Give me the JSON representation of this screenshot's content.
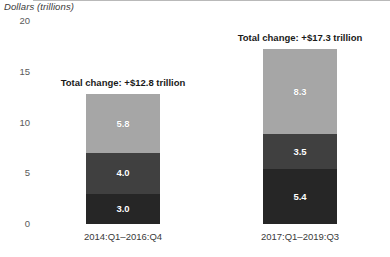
{
  "chart_data": {
    "type": "bar",
    "subtype": "stacked-vertical",
    "title": "",
    "subtitle": "",
    "ylabel": "Dollars (trillions)",
    "xlabel": "",
    "ylim": [
      0,
      20
    ],
    "yticks": [
      0,
      5,
      10,
      15,
      20
    ],
    "ytick_labels": [
      "0",
      "5",
      "10",
      "15",
      "20"
    ],
    "grid": false,
    "zero_line": true,
    "legend": null,
    "legend_position": "none",
    "categories": [
      "2014:Q1–2016:Q4",
      "2017:Q1–2019:Q3"
    ],
    "series": [
      {
        "name": "bottom-segment",
        "color": "#262626",
        "values": [
          3.0,
          5.4
        ],
        "labels": [
          "3.0",
          "5.4"
        ]
      },
      {
        "name": "middle-segment",
        "color": "#404040",
        "values": [
          4.0,
          3.5
        ],
        "labels": [
          "4.0",
          "3.5"
        ]
      },
      {
        "name": "top-segment",
        "color": "#a6a6a6",
        "values": [
          5.8,
          8.3
        ],
        "labels": [
          "5.8",
          "8.3"
        ]
      }
    ],
    "annotations": [
      {
        "name": "total-change-left",
        "text": "Total change: +$12.8 trillion",
        "category": "2014:Q1–2016:Q4",
        "value": 12.8
      },
      {
        "name": "total-change-right",
        "text": "Total change: +$17.3 trillion",
        "category": "2017:Q1–2019:Q3",
        "value": 17.3
      }
    ],
    "colors": {
      "bottom": "#262626",
      "middle": "#404040",
      "top": "#a6a6a6",
      "axis_line": "#b9b9b9",
      "tick_text": "#5a5a5a",
      "label_text": "#3a3a3a",
      "annotation_text": "#1a1a1a",
      "segment_label_text": "#ffffff",
      "background": "#ffffff"
    }
  },
  "axis": {
    "y_title": "Dollars (trillions)",
    "ticks": [
      "20",
      "15",
      "10",
      "5",
      "0"
    ]
  },
  "bars": {
    "left": {
      "category_label": "2014:Q1–2016:Q4",
      "annotation": "Total change: +$12.8 trillion",
      "segments": [
        "5.8",
        "4.0",
        "3.0"
      ]
    },
    "right": {
      "category_label": "2017:Q1–2019:Q3",
      "annotation": "Total change: +$17.3 trillion",
      "segments": [
        "8.3",
        "3.5",
        "5.4"
      ]
    }
  }
}
